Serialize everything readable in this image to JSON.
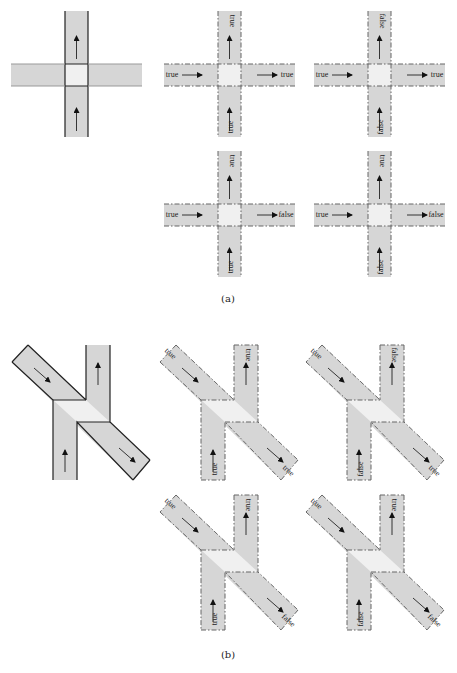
{
  "figure": {
    "colors": {
      "road": "#d6d6d6",
      "intersection": "#f0f0f0",
      "border_solid": "#222222",
      "border_dashed": "#666666"
    },
    "captions": {
      "a": "(a)",
      "b": "(b)"
    },
    "part_a": {
      "type": "four-way intersection",
      "reference": {
        "name": "cross-base",
        "arrows": [
          "up-bottom",
          "up-top"
        ]
      },
      "variants": [
        {
          "name": "cross-tt-tt",
          "left_in": "true",
          "right_out": "true",
          "bottom_in": "true",
          "top_out": "true"
        },
        {
          "name": "cross-tt-ff",
          "left_in": "true",
          "right_out": "true",
          "bottom_in": "false",
          "top_out": "false"
        },
        {
          "name": "cross-tf-tt",
          "left_in": "true",
          "right_out": "false",
          "bottom_in": "true",
          "top_out": "true"
        },
        {
          "name": "cross-tf-ft",
          "left_in": "true",
          "right_out": "false",
          "bottom_in": "false",
          "top_out": "true"
        }
      ]
    },
    "part_b": {
      "type": "diagonal crossing (N-shape)",
      "reference": {
        "name": "n-base"
      },
      "variants": [
        {
          "name": "n-tt-tt",
          "diag_in": "true",
          "diag_out": "true",
          "bottom_in": "true",
          "top_out": "true"
        },
        {
          "name": "n-tt-ff",
          "diag_in": "true",
          "diag_out": "true",
          "bottom_in": "false",
          "top_out": "false"
        },
        {
          "name": "n-tf-tt",
          "diag_in": "true",
          "diag_out": "false",
          "bottom_in": "true",
          "top_out": "true"
        },
        {
          "name": "n-tf-ft",
          "diag_in": "true",
          "diag_out": "false",
          "bottom_in": "false",
          "top_out": "true"
        }
      ]
    }
  }
}
